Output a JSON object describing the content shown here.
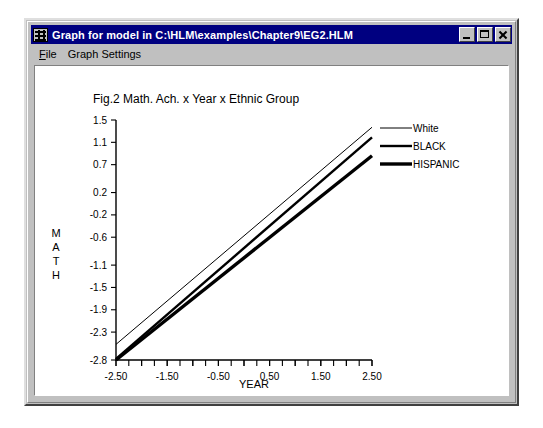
{
  "window": {
    "title": "Graph for model in C:\\HLM\\examples\\Chapter9\\EG2.HLM",
    "icon": "chart-grid-icon",
    "buttons": {
      "minimize": "minimize-button",
      "maximize": "maximize-button",
      "close": "close-button"
    }
  },
  "menu": {
    "items": [
      {
        "accel": "F",
        "rest": "ile",
        "name": "file"
      },
      {
        "accel": "",
        "rest": "Graph Settings",
        "name": "graph-settings"
      }
    ]
  },
  "chart_data": {
    "type": "line",
    "title": "Fig.2 Math. Ach. x Year x Ethnic Group",
    "xlabel": "YEAR",
    "ylabel": "MATH",
    "ylabel_letters": [
      "M",
      "A",
      "T",
      "H"
    ],
    "xlim": [
      -2.5,
      2.5
    ],
    "ylim": [
      -2.8,
      1.5
    ],
    "grid": false,
    "legend_position": "right",
    "x_ticks": [
      -2.5,
      -1.5,
      -0.5,
      0.5,
      1.5,
      2.5
    ],
    "x_tick_labels": [
      "-2.50",
      "-1.50",
      "-0.50",
      "0.50",
      "1.50",
      "2.50"
    ],
    "x_minor_ticks": [
      -2.0,
      -1.0,
      0.0,
      1.0,
      2.0
    ],
    "y_ticks": [
      1.5,
      1.1,
      0.7,
      0.2,
      -0.2,
      -0.6,
      -1.1,
      -1.5,
      -1.9,
      -2.3,
      -2.8
    ],
    "y_tick_labels": [
      "1.5",
      "1.1",
      "0.7",
      "0.2",
      "-0.2",
      "-0.6",
      "-1.1",
      "-1.5",
      "-1.9",
      "-2.3",
      "-2.8"
    ],
    "x": [
      -2.5,
      2.5
    ],
    "series": [
      {
        "name": "White",
        "values": [
          -2.52,
          1.37
        ],
        "stroke_width": 1.0
      },
      {
        "name": "BLACK",
        "values": [
          -2.78,
          1.19
        ],
        "stroke_width": 2.4
      },
      {
        "name": "HISPANIC",
        "values": [
          -2.8,
          0.86
        ],
        "stroke_width": 3.4
      }
    ],
    "legend": [
      {
        "label": "White",
        "stroke_width": 1.0
      },
      {
        "label": "BLACK",
        "stroke_width": 2.4
      },
      {
        "label": "HISPANIC",
        "stroke_width": 3.4
      }
    ]
  },
  "colors": {
    "titlebar": "#000080",
    "chrome": "#c0c0c0",
    "plot_bg": "#ffffff",
    "ink": "#000000"
  }
}
